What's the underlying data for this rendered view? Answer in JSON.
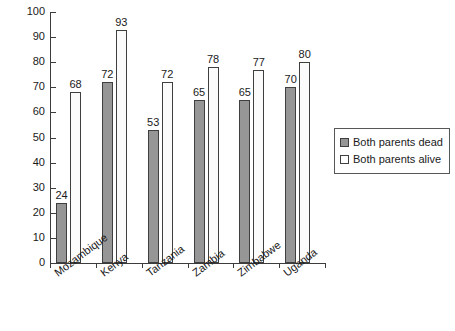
{
  "chart_data": {
    "type": "bar",
    "title": "",
    "subtitle": "",
    "xlabel": "",
    "ylabel": "",
    "ylim": [
      0,
      100
    ],
    "ytick_step": 10,
    "yticks": [
      0,
      10,
      20,
      30,
      40,
      50,
      60,
      70,
      80,
      90,
      100
    ],
    "grid": false,
    "legend_position": "right",
    "data_labels": true,
    "categories": [
      "Mozambique",
      "Kenya",
      "Tanzania",
      "Zambia",
      "Zimbabwe",
      "Uganda"
    ],
    "series": [
      {
        "name": "Both parents dead",
        "color": "#969696",
        "values": [
          24,
          72,
          53,
          65,
          65,
          70
        ]
      },
      {
        "name": "Both parents alive",
        "color": "#ffffff",
        "values": [
          68,
          93,
          72,
          78,
          77,
          80
        ]
      }
    ]
  },
  "legend": {
    "items": [
      {
        "label": "Both parents dead",
        "swatch": "dead"
      },
      {
        "label": "Both parents alive",
        "swatch": "alive"
      }
    ]
  }
}
